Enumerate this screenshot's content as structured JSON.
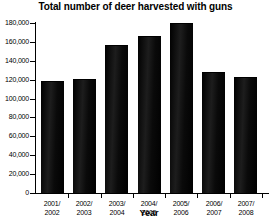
{
  "chart_data": {
    "type": "bar",
    "title": "Total number of deer harvested with guns",
    "xlabel": "Year",
    "ylabel": "",
    "categories": [
      "2001/\n2002",
      "2002/\n2003",
      "2003/\n2004",
      "2004/\n2005",
      "2005/\n2006",
      "2006/\n2007",
      "2007/\n2008"
    ],
    "category_lines": [
      [
        "2001/",
        "2002"
      ],
      [
        "2002/",
        "2003"
      ],
      [
        "2003/",
        "2004"
      ],
      [
        "2004/",
        "2005"
      ],
      [
        "2005/",
        "2006"
      ],
      [
        "2006/",
        "2007"
      ],
      [
        "2007/",
        "2008"
      ]
    ],
    "values": [
      118000,
      120000,
      156000,
      165000,
      179000,
      127000,
      122000
    ],
    "ylim": [
      0,
      180000
    ],
    "ytick_values": [
      180000,
      160000,
      140000,
      120000,
      100000,
      80000,
      60000,
      40000,
      20000,
      0
    ],
    "ytick_labels": [
      "180,000",
      "160,000",
      "140,000",
      "120,000",
      "100,000",
      "80,000",
      "60,000",
      "40,000",
      "20,000",
      "0"
    ],
    "grid": false,
    "legend": null,
    "bar_color": "#111111",
    "axis_color": "#000000",
    "background": "#ffffff"
  }
}
